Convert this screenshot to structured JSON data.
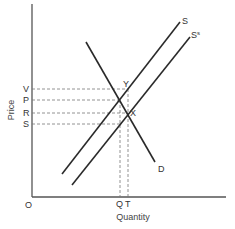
{
  "diagram": {
    "type": "supply-demand-subsidy",
    "axes": {
      "x_label": "Quantity",
      "y_label": "Price",
      "origin_label": "O"
    },
    "curves": [
      {
        "id": "supply",
        "label": "S"
      },
      {
        "id": "supply_subsidy",
        "label": "S",
        "label_superscript": "s"
      },
      {
        "id": "demand",
        "label": "D"
      }
    ],
    "price_levels": [
      {
        "label": "V"
      },
      {
        "label": "P"
      },
      {
        "label": "R"
      },
      {
        "label": "S"
      }
    ],
    "quantity_levels": [
      {
        "label": "Q"
      },
      {
        "label": "T"
      }
    ],
    "points": [
      {
        "label": "Y"
      },
      {
        "label": "X"
      }
    ]
  }
}
